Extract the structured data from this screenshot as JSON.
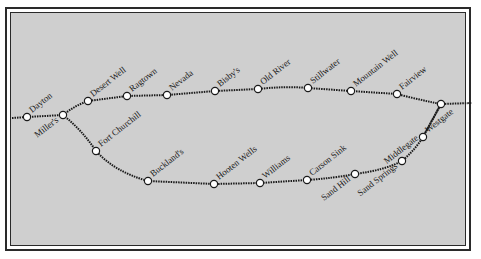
{
  "map": {
    "title": "Pony Express route map",
    "background_color": "#cfcfcf",
    "line_color": "#1a1a1a",
    "stations": [
      {
        "name": "Dayton",
        "x": 27,
        "y": 117,
        "label_side": "up"
      },
      {
        "name": "Miller's",
        "x": 63,
        "y": 115,
        "label_side": "down"
      },
      {
        "name": "Desert Well",
        "x": 88,
        "y": 101,
        "label_side": "up"
      },
      {
        "name": "Ragtown",
        "x": 127,
        "y": 96,
        "label_side": "up"
      },
      {
        "name": "Nevada",
        "x": 167,
        "y": 95,
        "label_side": "up"
      },
      {
        "name": "Bisby's",
        "x": 215,
        "y": 91,
        "label_side": "up"
      },
      {
        "name": "Old River",
        "x": 258,
        "y": 89,
        "label_side": "up"
      },
      {
        "name": "Stillwater",
        "x": 308,
        "y": 88,
        "label_side": "up"
      },
      {
        "name": "Mountain Well",
        "x": 351,
        "y": 91,
        "label_side": "up"
      },
      {
        "name": "Fairview",
        "x": 397,
        "y": 94,
        "label_side": "up"
      },
      {
        "name": "Fort Churchill",
        "x": 96,
        "y": 151,
        "label_side": "up"
      },
      {
        "name": "Buckland's",
        "x": 148,
        "y": 181,
        "label_side": "up"
      },
      {
        "name": "Hooten Wells",
        "x": 214,
        "y": 184,
        "label_side": "up"
      },
      {
        "name": "Williams",
        "x": 260,
        "y": 183,
        "label_side": "up"
      },
      {
        "name": "Carson Sink",
        "x": 307,
        "y": 180,
        "label_side": "up"
      },
      {
        "name": "Sand Hill",
        "x": 355,
        "y": 174,
        "label_side": "down"
      },
      {
        "name": "Sand Springs",
        "x": 402,
        "y": 161,
        "label_side": "down"
      },
      {
        "name": "Middlegate",
        "x": 423,
        "y": 137,
        "label_side": "up-left"
      },
      {
        "name": "Westgate",
        "x": 423,
        "y": 137,
        "label_side": "up"
      },
      {
        "name": "Junction East",
        "x": 441,
        "y": 104,
        "label_side": "none"
      }
    ]
  }
}
